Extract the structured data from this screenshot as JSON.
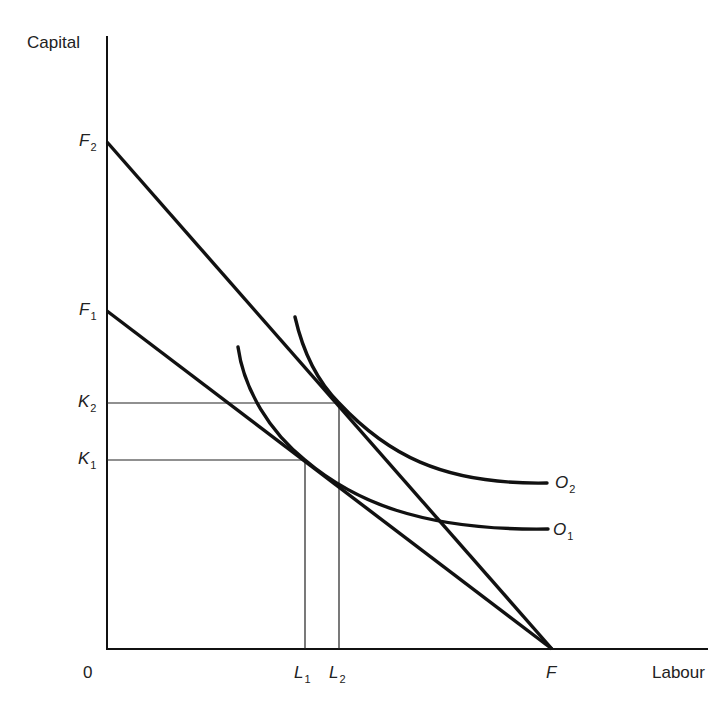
{
  "diagram": {
    "axes": {
      "y_label": "Capital",
      "x_label": "Labour",
      "origin_label": "0"
    },
    "y_axis_points": [
      {
        "id": "F2",
        "base": "F",
        "sub": "2"
      },
      {
        "id": "F1",
        "base": "F",
        "sub": "1"
      },
      {
        "id": "K2",
        "base": "K",
        "sub": "2"
      },
      {
        "id": "K1",
        "base": "K",
        "sub": "1"
      }
    ],
    "x_axis_points": [
      {
        "id": "L1",
        "base": "L",
        "sub": "1"
      },
      {
        "id": "L2",
        "base": "L",
        "sub": "2"
      },
      {
        "id": "F",
        "base": "F",
        "sub": ""
      }
    ],
    "curves": [
      {
        "id": "O2",
        "base": "O",
        "sub": "2",
        "type": "isoquant"
      },
      {
        "id": "O1",
        "base": "O",
        "sub": "1",
        "type": "isoquant"
      }
    ],
    "lines": [
      {
        "id": "F2-F",
        "from": "F2",
        "to": "F",
        "type": "isocost"
      },
      {
        "id": "F1-F",
        "from": "F1",
        "to": "F",
        "type": "isocost"
      }
    ],
    "guides": [
      {
        "id": "K2-L2",
        "desc": "tangency of O2 with F2F at (L2, K2)"
      },
      {
        "id": "K1-L1",
        "desc": "tangency of O1 with F1F at (L1, K1)"
      }
    ],
    "colors": {
      "ink": "#111111",
      "background": "#ffffff"
    }
  }
}
